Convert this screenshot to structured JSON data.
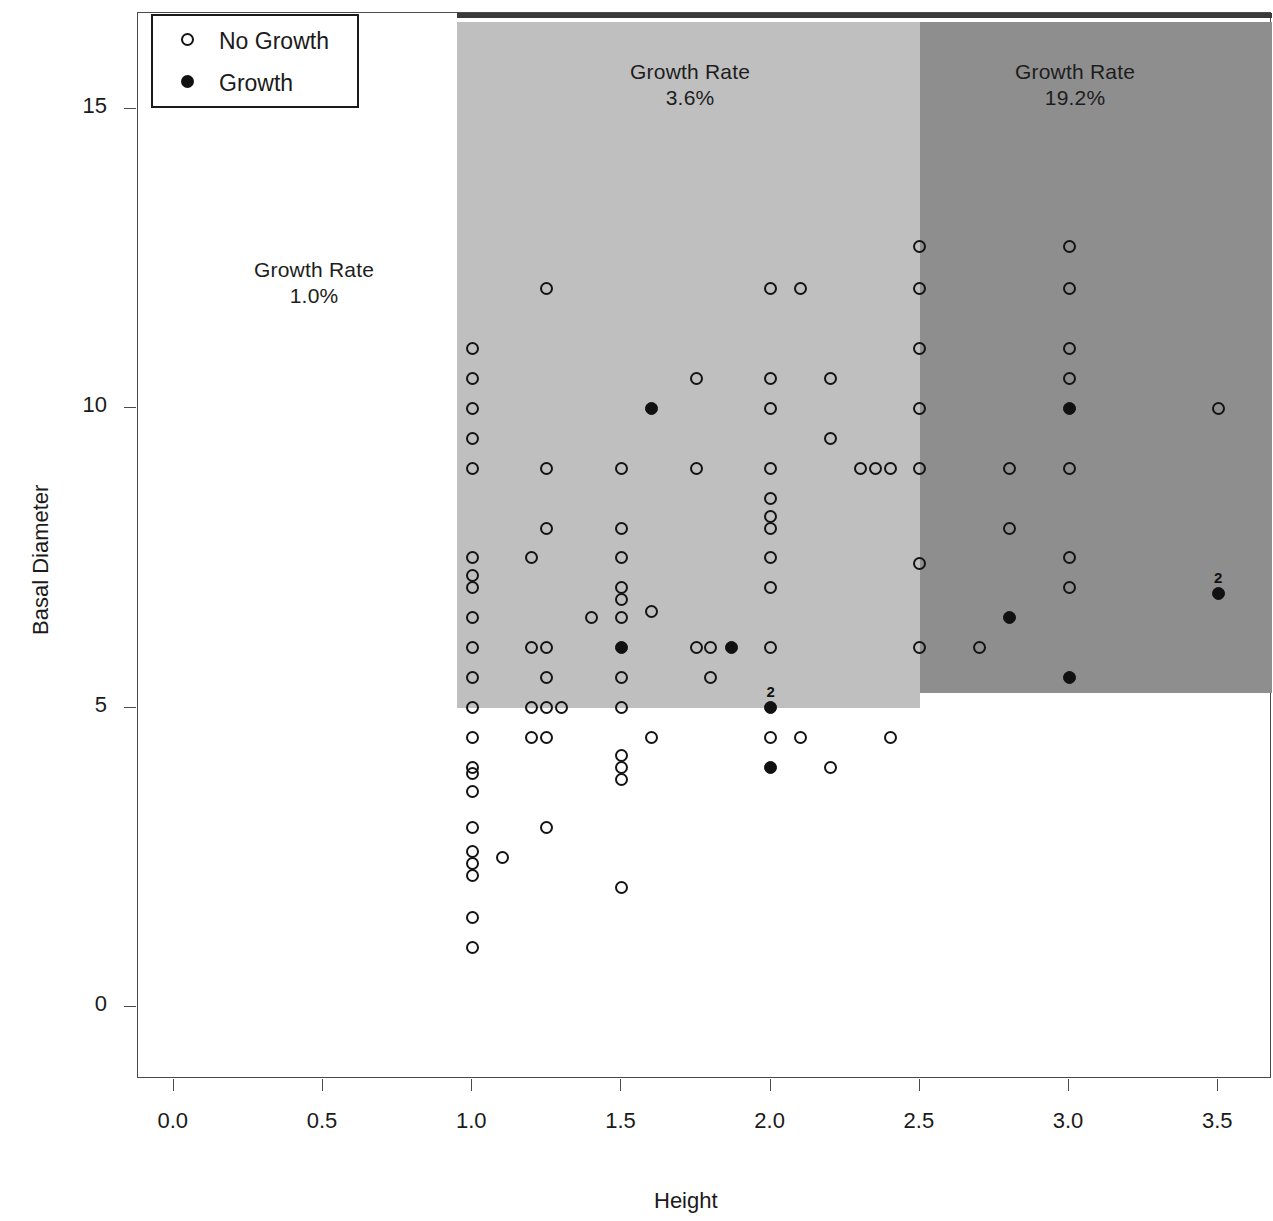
{
  "chart_data": {
    "type": "scatter",
    "title": "",
    "xlabel": "Height",
    "ylabel": "Basal Diameter",
    "xlim": [
      -0.12,
      3.68
    ],
    "ylim": [
      -1.2,
      16.6
    ],
    "x_ticks": [
      "0.0",
      "0.5",
      "1.0",
      "1.5",
      "2.0",
      "2.5",
      "3.0",
      "3.5"
    ],
    "x_tick_values": [
      0.0,
      0.5,
      1.0,
      1.5,
      2.0,
      2.5,
      3.0,
      3.5
    ],
    "y_ticks": [
      "0",
      "5",
      "10",
      "15"
    ],
    "y_tick_values": [
      0,
      5,
      10,
      15
    ],
    "grid": false,
    "legend_position": "top-left",
    "legend": [
      {
        "label": "No Growth",
        "marker": "open-circle"
      },
      {
        "label": "Growth",
        "marker": "filled-circle"
      }
    ],
    "annotations": [
      {
        "id": "region-low",
        "text": "Growth Rate\n1.0%",
        "x": 0.47,
        "y": 12.3
      },
      {
        "id": "region-mid",
        "text": "Growth Rate\n3.6%",
        "x": 1.73,
        "y": 15.6
      },
      {
        "id": "region-high",
        "text": "Growth Rate\n19.2%",
        "x": 3.02,
        "y": 15.6
      }
    ],
    "regions": [
      {
        "id": "low",
        "label": "Growth Rate 1.0%",
        "rate": "1.0%",
        "x_range": [
          0.0,
          0.95
        ],
        "shade": "#ffffff"
      },
      {
        "id": "mid",
        "label": "Growth Rate 3.6%",
        "rate": "3.6%",
        "x_range": [
          0.95,
          2.5
        ],
        "y_range": [
          5.0,
          16.45
        ],
        "shade": "#bfbfbf"
      },
      {
        "id": "high",
        "label": "Growth Rate 19.2%",
        "rate": "19.2%",
        "x_range": [
          2.5,
          3.68
        ],
        "y_range": [
          5.25,
          16.45
        ],
        "shade": "#8e8e8e"
      }
    ],
    "header_band": {
      "x_range": [
        0.95,
        3.68
      ],
      "color": "#3a3a3a"
    },
    "series": [
      {
        "name": "No Growth",
        "marker": "open-circle",
        "points": [
          [
            1.0,
            11.0
          ],
          [
            1.0,
            10.5
          ],
          [
            1.0,
            10.0
          ],
          [
            1.0,
            9.5
          ],
          [
            1.0,
            9.0
          ],
          [
            1.0,
            7.5
          ],
          [
            1.0,
            7.2
          ],
          [
            1.0,
            7.0
          ],
          [
            1.0,
            6.5
          ],
          [
            1.0,
            6.0
          ],
          [
            1.0,
            5.5
          ],
          [
            1.0,
            5.0
          ],
          [
            1.0,
            4.5
          ],
          [
            1.0,
            4.0
          ],
          [
            1.0,
            3.9
          ],
          [
            1.0,
            3.6
          ],
          [
            1.0,
            3.0
          ],
          [
            1.0,
            2.6
          ],
          [
            1.0,
            2.4
          ],
          [
            1.0,
            2.2
          ],
          [
            1.0,
            1.5
          ],
          [
            1.0,
            1.0
          ],
          [
            1.1,
            2.5
          ],
          [
            1.2,
            7.5
          ],
          [
            1.2,
            6.0
          ],
          [
            1.2,
            5.0
          ],
          [
            1.2,
            4.5
          ],
          [
            1.25,
            12.0
          ],
          [
            1.25,
            9.0
          ],
          [
            1.25,
            8.0
          ],
          [
            1.25,
            6.0
          ],
          [
            1.25,
            5.5
          ],
          [
            1.25,
            5.0
          ],
          [
            1.25,
            4.5
          ],
          [
            1.25,
            3.0
          ],
          [
            1.3,
            5.0
          ],
          [
            1.4,
            6.5
          ],
          [
            1.5,
            9.0
          ],
          [
            1.5,
            8.0
          ],
          [
            1.5,
            7.5
          ],
          [
            1.5,
            7.0
          ],
          [
            1.5,
            6.8
          ],
          [
            1.5,
            6.5
          ],
          [
            1.5,
            5.5
          ],
          [
            1.5,
            5.0
          ],
          [
            1.5,
            4.2
          ],
          [
            1.5,
            4.0
          ],
          [
            1.5,
            3.8
          ],
          [
            1.5,
            2.0
          ],
          [
            1.6,
            6.6
          ],
          [
            1.6,
            4.5
          ],
          [
            1.75,
            10.5
          ],
          [
            1.75,
            9.0
          ],
          [
            1.75,
            6.0
          ],
          [
            1.8,
            6.0
          ],
          [
            1.8,
            5.5
          ],
          [
            2.0,
            12.0
          ],
          [
            2.0,
            10.5
          ],
          [
            2.0,
            10.0
          ],
          [
            2.0,
            9.0
          ],
          [
            2.0,
            8.5
          ],
          [
            2.0,
            8.2
          ],
          [
            2.0,
            8.0
          ],
          [
            2.0,
            7.5
          ],
          [
            2.0,
            7.0
          ],
          [
            2.0,
            6.0
          ],
          [
            2.0,
            4.5
          ],
          [
            2.1,
            12.0
          ],
          [
            2.1,
            4.5
          ],
          [
            2.2,
            10.5
          ],
          [
            2.2,
            9.5
          ],
          [
            2.2,
            4.0
          ],
          [
            2.3,
            9.0
          ],
          [
            2.35,
            9.0
          ],
          [
            2.4,
            9.0
          ],
          [
            2.4,
            4.5
          ],
          [
            2.5,
            12.7
          ],
          [
            2.5,
            12.0
          ],
          [
            2.5,
            11.0
          ],
          [
            2.5,
            10.0
          ],
          [
            2.5,
            9.0
          ],
          [
            2.5,
            7.4
          ],
          [
            2.5,
            6.0
          ],
          [
            2.7,
            6.0
          ],
          [
            2.8,
            8.0
          ],
          [
            2.8,
            9.0
          ],
          [
            3.0,
            12.7
          ],
          [
            3.0,
            12.0
          ],
          [
            3.0,
            11.0
          ],
          [
            3.0,
            10.5
          ],
          [
            3.0,
            9.0
          ],
          [
            3.0,
            7.5
          ],
          [
            3.0,
            7.0
          ],
          [
            3.5,
            10.0
          ]
        ]
      },
      {
        "name": "Growth",
        "marker": "filled-circle",
        "points": [
          [
            1.6,
            10.0
          ],
          [
            1.5,
            6.0
          ],
          [
            1.87,
            6.0
          ],
          [
            2.0,
            5.0
          ],
          [
            2.0,
            4.0
          ],
          [
            2.8,
            6.5
          ],
          [
            3.0,
            10.0
          ],
          [
            3.0,
            5.5
          ],
          [
            3.5,
            6.9
          ]
        ]
      }
    ],
    "point_count_labels": [
      {
        "x": 2.0,
        "y": 5.0,
        "text": "2"
      },
      {
        "x": 3.5,
        "y": 6.9,
        "text": "2"
      }
    ]
  }
}
